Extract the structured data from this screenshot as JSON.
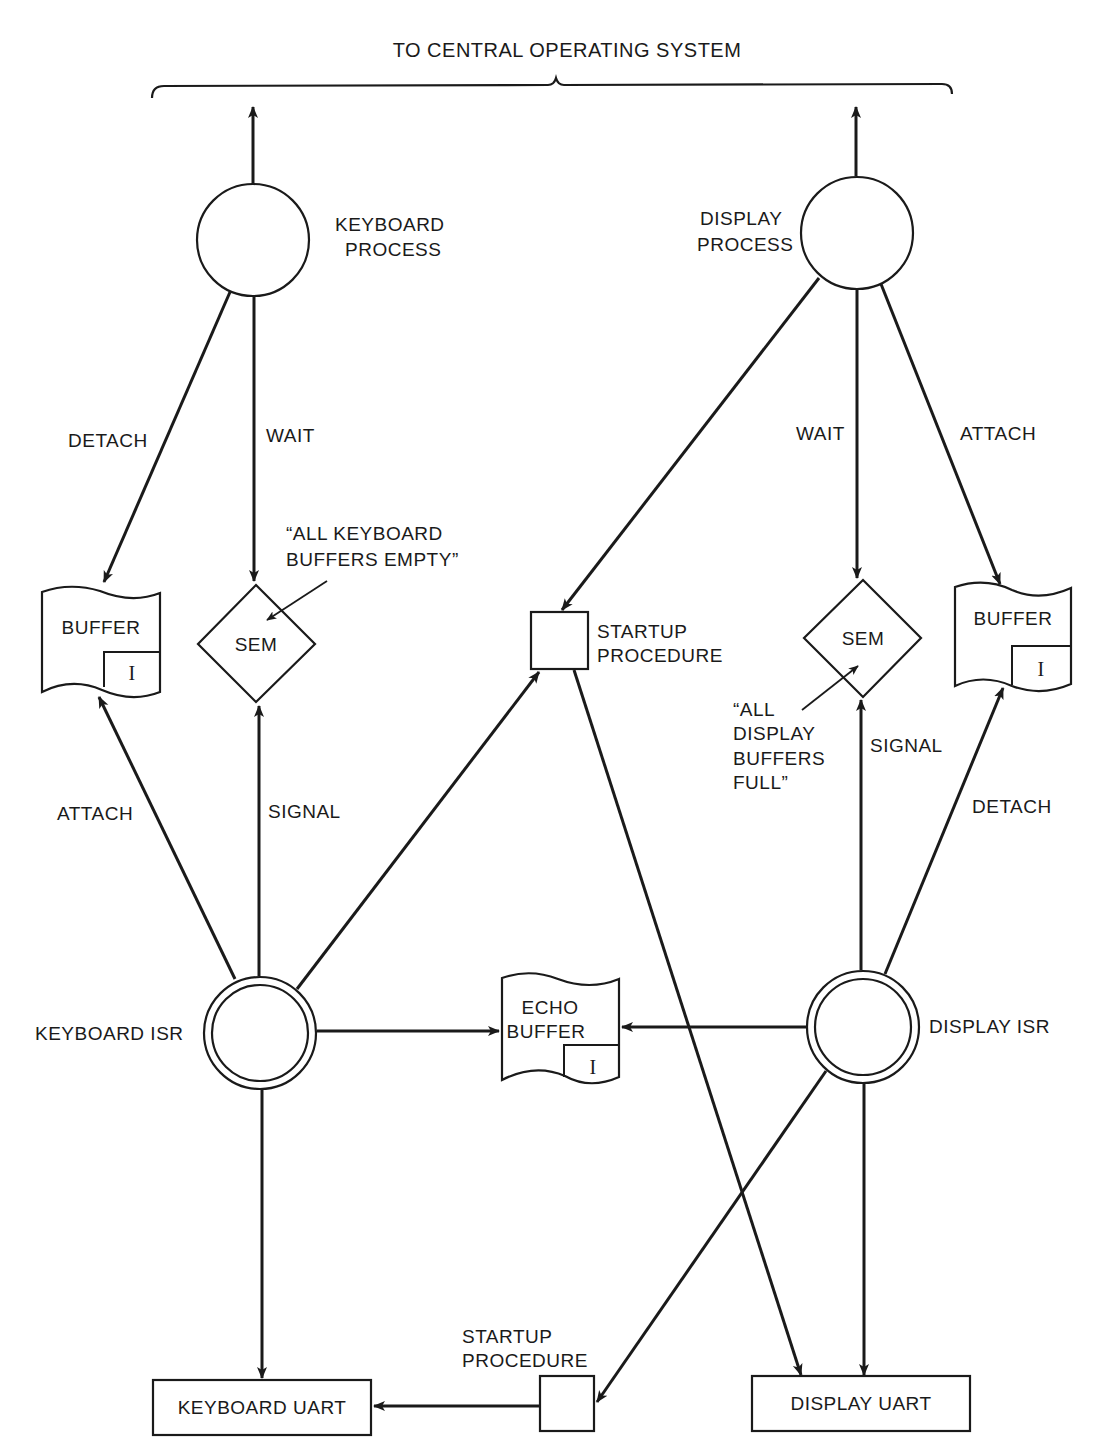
{
  "diagram": {
    "title": "TO CENTRAL OPERATING SYSTEM",
    "nodes": {
      "keyboard_process": {
        "line1": "KEYBOARD",
        "line2": "PROCESS"
      },
      "display_process": {
        "line1": "DISPLAY",
        "line2": "PROCESS"
      },
      "keyboard_buffer": {
        "label": "BUFFER",
        "index": "I"
      },
      "keyboard_sem": {
        "label": "SEM"
      },
      "startup_top": {
        "line1": "STARTUP",
        "line2": "PROCEDURE"
      },
      "display_sem": {
        "label": "SEM"
      },
      "display_buffer": {
        "label": "BUFFER",
        "index": "I"
      },
      "keyboard_isr": {
        "label": "KEYBOARD ISR"
      },
      "echo_buffer": {
        "line1": "ECHO",
        "line2": "BUFFER",
        "index": "I"
      },
      "display_isr": {
        "label": "DISPLAY ISR"
      },
      "startup_bottom": {
        "line1": "STARTUP",
        "line2": "PROCEDURE"
      },
      "keyboard_uart": {
        "label": "KEYBOARD UART"
      },
      "display_uart": {
        "label": "DISPLAY UART"
      }
    },
    "edge_labels": {
      "kb_detach": "DETACH",
      "kb_wait": "WAIT",
      "kb_attach": "ATTACH",
      "kb_signal": "SIGNAL",
      "dp_wait": "WAIT",
      "dp_attach": "ATTACH",
      "dp_signal": "SIGNAL",
      "dp_detach": "DETACH"
    },
    "annotations": {
      "keyboard_sem_note": {
        "line1": "“ALL KEYBOARD",
        "line2": "BUFFERS EMPTY”"
      },
      "display_sem_note": {
        "line1": "“ALL",
        "line2": "DISPLAY",
        "line3": "BUFFERS",
        "line4": "FULL”"
      }
    }
  }
}
